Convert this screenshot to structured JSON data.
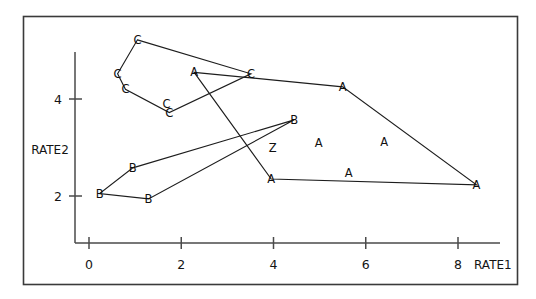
{
  "chart_data": {
    "type": "scatter",
    "title": "",
    "subtitle": "",
    "xlabel": "RATE1",
    "ylabel": "RATE2",
    "xlim": [
      -0.35,
      8.9
    ],
    "ylim": [
      0.9,
      5.6
    ],
    "xticks": [
      0,
      2,
      4,
      6,
      8
    ],
    "xticklabels": [
      "0",
      "2",
      "4",
      "6",
      "8"
    ],
    "yticks": [
      2,
      4
    ],
    "yticklabels": [
      "2",
      "4"
    ],
    "grid": false,
    "legend": false,
    "marker_style": "letter-glyph",
    "annotation_note": "Cluster letters A, B, C mark group membership; Z marks an overlapping/tied point. Convex hulls drawn around each cluster.",
    "points": [
      {
        "label": "C",
        "x": 1.05,
        "y": 5.22
      },
      {
        "label": "C",
        "x": 0.62,
        "y": 4.52
      },
      {
        "label": "C",
        "x": 1.68,
        "y": 3.9
      },
      {
        "label": "C",
        "x": 0.79,
        "y": 4.2
      },
      {
        "label": "C",
        "x": 1.74,
        "y": 3.72
      },
      {
        "label": "C",
        "x": 3.51,
        "y": 4.52
      },
      {
        "label": "A",
        "x": 2.28,
        "y": 4.55
      },
      {
        "label": "A",
        "x": 5.5,
        "y": 4.25
      },
      {
        "label": "A",
        "x": 8.4,
        "y": 2.23
      },
      {
        "label": "A",
        "x": 3.95,
        "y": 2.35
      },
      {
        "label": "A",
        "x": 5.63,
        "y": 2.48
      },
      {
        "label": "A",
        "x": 4.98,
        "y": 3.1
      },
      {
        "label": "A",
        "x": 6.4,
        "y": 3.12
      },
      {
        "label": "B",
        "x": 4.45,
        "y": 3.57
      },
      {
        "label": "B",
        "x": 0.95,
        "y": 2.58
      },
      {
        "label": "B",
        "x": 0.23,
        "y": 2.05
      },
      {
        "label": "B",
        "x": 1.29,
        "y": 1.94
      },
      {
        "label": "Z",
        "x": 3.98,
        "y": 3.0
      }
    ],
    "hulls": [
      {
        "cluster": "C",
        "vertices": [
          {
            "x": 1.05,
            "y": 5.22
          },
          {
            "x": 3.51,
            "y": 4.52
          },
          {
            "x": 1.74,
            "y": 3.72
          },
          {
            "x": 0.79,
            "y": 4.2
          },
          {
            "x": 0.62,
            "y": 4.52
          }
        ]
      },
      {
        "cluster": "A",
        "vertices": [
          {
            "x": 2.28,
            "y": 4.55
          },
          {
            "x": 5.5,
            "y": 4.25
          },
          {
            "x": 8.4,
            "y": 2.23
          },
          {
            "x": 3.95,
            "y": 2.35
          }
        ]
      },
      {
        "cluster": "B",
        "vertices": [
          {
            "x": 4.45,
            "y": 3.57
          },
          {
            "x": 0.95,
            "y": 2.58
          },
          {
            "x": 0.23,
            "y": 2.05
          },
          {
            "x": 1.29,
            "y": 1.94
          }
        ]
      }
    ],
    "colors": {
      "frame": "#3a3a3a",
      "axis": "#4a4a4a",
      "line": "#1d1d1d",
      "text": "#101010",
      "background": "#ffffff"
    }
  }
}
